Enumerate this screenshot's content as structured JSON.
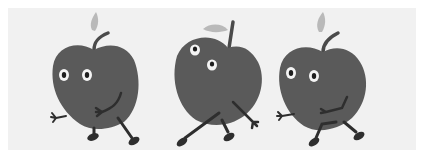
{
  "image": {
    "description": "Three cartoon apples with eyes, arms and legs walking to the right",
    "caption": "Three walking cartoon apples",
    "colors": {
      "background": "#ffffff",
      "panel": "#f1f1f1",
      "apple": "#5a5a5a",
      "limbs": "#2e2e2e",
      "leaf": "#b9b9b9",
      "eye_white": "#f4f4f4",
      "pupil": "#1e1e1e"
    },
    "characters": [
      {
        "name": "left-apple",
        "pose": "walking, looking forward"
      },
      {
        "name": "middle-apple",
        "pose": "striding, eyes looking up"
      },
      {
        "name": "right-apple",
        "pose": "walking, hand on belly"
      }
    ]
  }
}
